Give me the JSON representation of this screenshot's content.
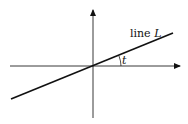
{
  "diagram": {
    "line_label_prefix": "line ",
    "line_label_var": "L",
    "angle_label": "t",
    "colors": {
      "axes": "#222222",
      "line": "#111111",
      "background": "#ffffff"
    }
  }
}
